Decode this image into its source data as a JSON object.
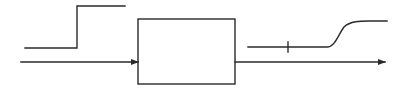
{
  "diagram": {
    "type": "block-diagram",
    "colors": {
      "stroke": "#2a2a2a",
      "background": "#ffffff"
    },
    "input_signal": {
      "shape": "step",
      "low_level_y": 48,
      "high_level_y": 6,
      "x_start": 25,
      "x_step": 77,
      "x_end": 125
    },
    "input_arrow": {
      "y": 62,
      "x_start": 21,
      "x_end": 138
    },
    "system_block": {
      "x": 138,
      "y": 19,
      "width": 97,
      "height": 65,
      "label": ""
    },
    "output_arrow": {
      "y": 62,
      "x_start": 235,
      "x_end": 385
    },
    "output_signal": {
      "shape": "delayed-s-curve",
      "low_level_y": 47,
      "high_level_y": 21,
      "x_start": 248,
      "delay_marker_x": 288,
      "rise_start_x": 327,
      "rise_end_x": 357,
      "x_end": 387
    }
  }
}
